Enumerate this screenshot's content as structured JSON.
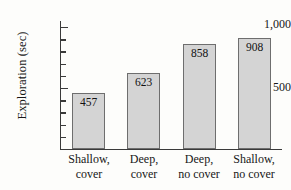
{
  "chart_data": {
    "type": "bar",
    "title": "",
    "xlabel": "",
    "ylabel": "Exploration (sec)",
    "categories": [
      "Shallow, cover",
      "Deep, cover",
      "Deep, no cover",
      "Shallow, no cover"
    ],
    "category_lines": [
      {
        "line1": "Shallow,",
        "line2": "cover"
      },
      {
        "line1": "Deep,",
        "line2": "cover"
      },
      {
        "line1": "Deep,",
        "line2": "no cover"
      },
      {
        "line1": "Shallow,",
        "line2": "no cover"
      }
    ],
    "values": [
      457,
      623,
      858,
      908
    ],
    "value_labels": [
      "457",
      "623",
      "858",
      "908"
    ],
    "ylim": [
      0,
      1050
    ],
    "y_major_ticks": [
      500,
      1000
    ],
    "y_major_tick_labels": [
      "500",
      "1,000"
    ],
    "y_minor_tick_interval": 100,
    "grid": false,
    "legend": false,
    "bar_fill_color": "#d4d4d4",
    "bar_border_color": "#6e6e6e",
    "axis_color": "#3a3a3a",
    "background_color": "#fdfdfb"
  },
  "axis": {
    "y_title": "Exploration (sec)",
    "y_label_1000": "1,000",
    "y_label_500": "500"
  }
}
